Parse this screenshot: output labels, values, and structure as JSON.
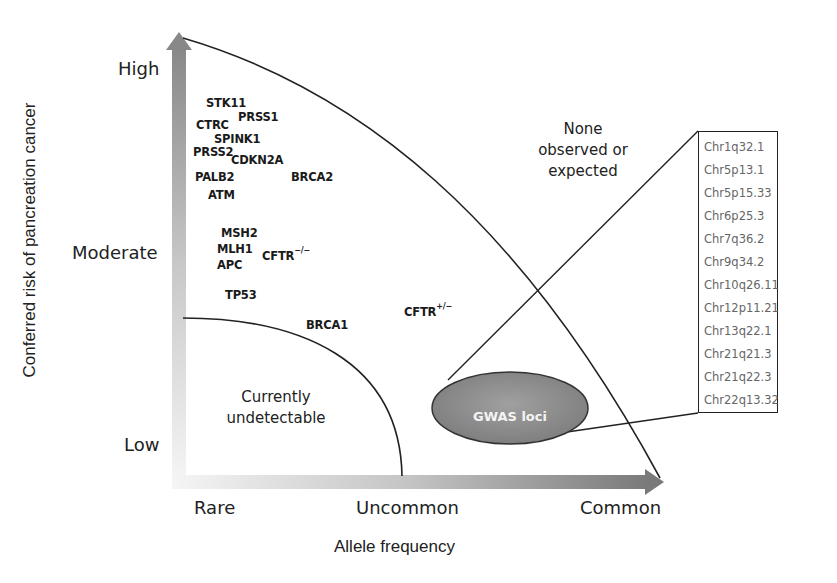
{
  "figure": {
    "y_axis": {
      "title": "Conferred risk of pancreation cancer",
      "ticks": [
        "High",
        "Moderate",
        "Low"
      ]
    },
    "x_axis": {
      "title": "Allele frequency",
      "ticks": [
        "Rare",
        "Uncommon",
        "Common"
      ]
    },
    "regions": {
      "none_observed": [
        "None",
        "observed or",
        "expected"
      ],
      "undetectable": [
        "Currently",
        "undetectable"
      ]
    },
    "genes": [
      {
        "name": "STK11"
      },
      {
        "name": "PRSS1"
      },
      {
        "name": "CTRC"
      },
      {
        "name": "SPINK1"
      },
      {
        "name": "PRSS2"
      },
      {
        "name": "CDKN2A"
      },
      {
        "name": "PALB2"
      },
      {
        "name": "BRCA2"
      },
      {
        "name": "ATM"
      },
      {
        "name": "MSH2"
      },
      {
        "name": "MLH1"
      },
      {
        "name": "APC"
      },
      {
        "name": "CFTR",
        "sup": "−/−"
      },
      {
        "name": "TP53"
      },
      {
        "name": "BRCA1"
      },
      {
        "name": "CFTR",
        "sup": "+/−"
      }
    ],
    "gwas": {
      "label": "GWAS loci",
      "loci": [
        "Chr1q32.1",
        "Chr5p13.1",
        "Chr5p15.33",
        "Chr6p25.3",
        "Chr7q36.2",
        "Chr9q34.2",
        "Chr10q26.11",
        "Chr12p11.21",
        "Chr13q22.1",
        "Chr21q21.3",
        "Chr21q22.3",
        "Chr22q13.32"
      ]
    },
    "colors": {
      "arrow_dark": "#7a7a7a",
      "arrow_light": "#f2f2f2",
      "ellipse_fill": "#8c8c8c",
      "line": "#222222",
      "loci_text": "#666666"
    }
  }
}
